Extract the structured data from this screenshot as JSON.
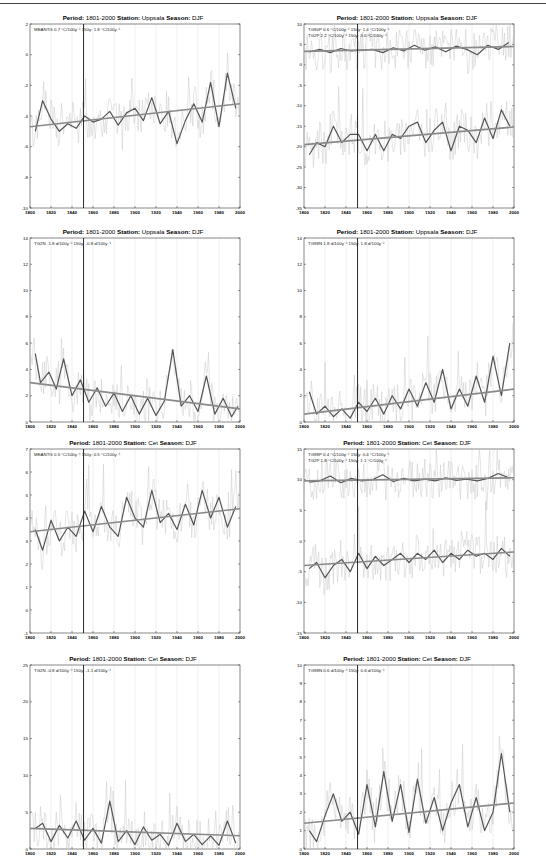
{
  "chart_data": [
    {
      "id": "p1",
      "type": "line",
      "title": {
        "period_label": "Period:",
        "period": "1801-2000",
        "station_label": "Station:",
        "station": "Uppsala",
        "season_label": "Season:",
        "season": "DJF"
      },
      "legend": [
        "MEANTG   0.7 °C/100y⁻¹ 150y: 1.8 °C/100y⁻¹"
      ],
      "xlim": [
        1800,
        2000
      ],
      "ylim": [
        -10,
        2
      ],
      "xticks": [
        "1800",
        "1820",
        "1840",
        "1860",
        "1880",
        "1900",
        "1920",
        "1940",
        "1960",
        "1980",
        "2000"
      ],
      "yticks": [
        "-10",
        "-8",
        "-6",
        "-4",
        "-2",
        "0",
        "2"
      ],
      "vline_year": 1851,
      "series": [
        {
          "name": "MEANTG smoothed",
          "x": [
            1805,
            1812,
            1820,
            1828,
            1836,
            1844,
            1852,
            1860,
            1868,
            1876,
            1884,
            1892,
            1900,
            1908,
            1916,
            1924,
            1932,
            1940,
            1948,
            1956,
            1964,
            1972,
            1980,
            1988,
            1996
          ],
          "values": [
            -5.0,
            -3.0,
            -4.2,
            -5.0,
            -4.5,
            -4.8,
            -4.0,
            -4.4,
            -4.2,
            -3.7,
            -4.6,
            -3.8,
            -3.5,
            -4.3,
            -2.8,
            -4.5,
            -3.7,
            -5.8,
            -4.3,
            -3.2,
            -4.4,
            -1.8,
            -4.7,
            -1.2,
            -3.5
          ]
        },
        {
          "name": "MEANTG trend",
          "x": [
            1800,
            2000
          ],
          "values": [
            -4.7,
            -3.2
          ]
        }
      ]
    },
    {
      "id": "p2",
      "type": "line",
      "title": {
        "period_label": "Period:",
        "period": "1801-2000",
        "station_label": "Station:",
        "station": "Uppsala",
        "season_label": "Season:",
        "season": "DJF"
      },
      "legend": [
        "TG90P   0.6 °C/100y⁻¹ 150y: 1.4 °C/100y⁻¹",
        "TG2P    2.2 °C/100y⁻¹ 150y: 3.0 °C/100y⁻¹"
      ],
      "xlim": [
        1800,
        2000
      ],
      "ylim": [
        -35,
        10
      ],
      "xticks": [
        "1800",
        "1820",
        "1840",
        "1860",
        "1880",
        "1900",
        "1920",
        "1940",
        "1960",
        "1980",
        "2000"
      ],
      "yticks": [
        "-35",
        "-30",
        "-25",
        "-20",
        "-15",
        "-10",
        "-5",
        "0",
        "5",
        "10"
      ],
      "vline_year": 1851,
      "series": [
        {
          "name": "TG90P smoothed",
          "x": [
            1805,
            1815,
            1825,
            1835,
            1845,
            1855,
            1865,
            1875,
            1885,
            1895,
            1905,
            1915,
            1925,
            1935,
            1945,
            1955,
            1965,
            1975,
            1985,
            1995
          ],
          "values": [
            3.2,
            3.8,
            3.0,
            4.0,
            3.4,
            3.6,
            3.8,
            3.0,
            4.2,
            3.4,
            4.8,
            3.6,
            4.4,
            3.2,
            4.6,
            3.8,
            2.5,
            4.8,
            3.8,
            5.5
          ]
        },
        {
          "name": "TG90P trend",
          "x": [
            1800,
            2000
          ],
          "values": [
            3.3,
            4.5
          ]
        },
        {
          "name": "TG2P smoothed",
          "x": [
            1805,
            1812,
            1820,
            1828,
            1836,
            1844,
            1852,
            1860,
            1868,
            1876,
            1884,
            1892,
            1900,
            1908,
            1916,
            1924,
            1932,
            1940,
            1948,
            1956,
            1964,
            1972,
            1980,
            1988,
            1996
          ],
          "values": [
            -22,
            -19,
            -20,
            -15,
            -19,
            -17,
            -17,
            -21,
            -17,
            -21,
            -17,
            -18,
            -15,
            -14,
            -19,
            -16,
            -14,
            -21,
            -15,
            -16,
            -19,
            -13,
            -18,
            -11,
            -15
          ]
        },
        {
          "name": "TG2P trend",
          "x": [
            1800,
            2000
          ],
          "values": [
            -19.5,
            -15.2
          ]
        }
      ]
    },
    {
      "id": "p3",
      "type": "line",
      "title": {
        "period_label": "Period:",
        "period": "1801-2000",
        "station_label": "Station:",
        "station": "Uppsala",
        "season_label": "Season:",
        "season": "DJF"
      },
      "legend": [
        "TG2N   -1.8 d/100y⁻¹ 150y: -0.8 d/100y⁻¹"
      ],
      "xlim": [
        1800,
        2000
      ],
      "ylim": [
        0,
        14
      ],
      "xticks": [
        "1800",
        "1820",
        "1840",
        "1860",
        "1880",
        "1900",
        "1920",
        "1940",
        "1960",
        "1980",
        "2000"
      ],
      "yticks": [
        "0",
        "2",
        "4",
        "6",
        "8",
        "10",
        "12",
        "14"
      ],
      "vline_year": 1851,
      "series": [
        {
          "name": "TG2N smoothed",
          "x": [
            1805,
            1810,
            1818,
            1825,
            1832,
            1840,
            1848,
            1856,
            1864,
            1872,
            1880,
            1888,
            1896,
            1904,
            1912,
            1920,
            1928,
            1936,
            1944,
            1952,
            1960,
            1968,
            1976,
            1984,
            1992,
            1998
          ],
          "values": [
            5.2,
            3.0,
            3.8,
            2.5,
            4.8,
            2.0,
            3.2,
            1.5,
            2.6,
            1.2,
            2.2,
            0.8,
            2.0,
            0.6,
            1.8,
            0.5,
            1.6,
            5.5,
            1.2,
            2.0,
            0.8,
            3.5,
            0.6,
            1.8,
            0.4,
            1.2
          ]
        },
        {
          "name": "TG2N trend",
          "x": [
            1800,
            2000
          ],
          "values": [
            3.0,
            1.0
          ]
        }
      ]
    },
    {
      "id": "p4",
      "type": "line",
      "title": {
        "period_label": "Period:",
        "period": "1801-2000",
        "station_label": "Station:",
        "station": "Uppsala",
        "season_label": "Season:",
        "season": "DJF"
      },
      "legend": [
        "TG98N   1.8 d/100y⁻¹ 150y: 1.8 d/100y⁻¹"
      ],
      "xlim": [
        1800,
        2000
      ],
      "ylim": [
        0,
        14
      ],
      "xticks": [
        "1800",
        "1820",
        "1840",
        "1860",
        "1880",
        "1900",
        "1920",
        "1940",
        "1960",
        "1980",
        "2000"
      ],
      "yticks": [
        "0",
        "2",
        "4",
        "6",
        "8",
        "10",
        "12",
        "14"
      ],
      "vline_year": 1851,
      "series": [
        {
          "name": "TG98N smoothed",
          "x": [
            1805,
            1812,
            1820,
            1828,
            1836,
            1844,
            1852,
            1860,
            1868,
            1876,
            1884,
            1892,
            1900,
            1908,
            1916,
            1924,
            1932,
            1940,
            1948,
            1956,
            1964,
            1972,
            1980,
            1988,
            1996
          ],
          "values": [
            2.3,
            0.6,
            1.2,
            0.4,
            1.0,
            0.3,
            1.5,
            0.8,
            1.8,
            0.6,
            2.0,
            1.0,
            2.5,
            1.2,
            3.0,
            1.5,
            4.0,
            1.0,
            2.5,
            1.2,
            3.5,
            1.5,
            5.0,
            2.0,
            6.0
          ]
        },
        {
          "name": "TG98N trend",
          "x": [
            1800,
            2000
          ],
          "values": [
            0.6,
            2.5
          ]
        }
      ]
    },
    {
      "id": "p5",
      "type": "line",
      "title": {
        "period_label": "Period:",
        "period": "1801-2000",
        "station_label": "Station:",
        "station": "Cet",
        "season_label": "Season:",
        "season": "DJF"
      },
      "legend": [
        "MEANTG   0.5 °C/100y⁻¹ 150y: 0.5 °C/100y⁻¹"
      ],
      "xlim": [
        1800,
        2000
      ],
      "ylim": [
        -1,
        7
      ],
      "xticks": [
        "1800",
        "1820",
        "1840",
        "1860",
        "1880",
        "1900",
        "1920",
        "1940",
        "1960",
        "1980",
        "2000"
      ],
      "yticks": [
        "-1",
        "0",
        "1",
        "2",
        "3",
        "4",
        "5",
        "6",
        "7"
      ],
      "vline_year": 1851,
      "series": [
        {
          "name": "MEANTG smoothed",
          "x": [
            1805,
            1812,
            1820,
            1828,
            1836,
            1844,
            1852,
            1860,
            1868,
            1876,
            1884,
            1892,
            1900,
            1908,
            1916,
            1924,
            1932,
            1940,
            1948,
            1956,
            1964,
            1972,
            1980,
            1988,
            1996
          ],
          "values": [
            3.5,
            2.6,
            3.9,
            3.0,
            3.6,
            3.2,
            4.3,
            3.4,
            4.5,
            3.6,
            3.2,
            4.9,
            4.0,
            3.6,
            5.2,
            3.8,
            4.2,
            3.5,
            4.6,
            3.7,
            5.2,
            4.0,
            4.9,
            3.6,
            4.5
          ]
        },
        {
          "name": "MEANTG trend",
          "x": [
            1800,
            2000
          ],
          "values": [
            3.4,
            4.4
          ]
        }
      ]
    },
    {
      "id": "p6",
      "type": "line",
      "title": {
        "period_label": "Period:",
        "period": "1801-2000",
        "station_label": "Station:",
        "station": "Cet",
        "season_label": "Season:",
        "season": "DJF"
      },
      "legend": [
        "TG98P   0.4 °C/100y⁻¹ 150y: 0.4 °C/100y⁻¹",
        "TG2P    1.8 °C/100y⁻¹ 150y: 1.1 °C/100y⁻¹"
      ],
      "xlim": [
        1800,
        2000
      ],
      "ylim": [
        -15,
        15
      ],
      "xticks": [
        "1800",
        "1820",
        "1840",
        "1860",
        "1880",
        "1900",
        "1920",
        "1940",
        "1960",
        "1980",
        "2000"
      ],
      "yticks": [
        "-15",
        "-10",
        "-5",
        "0",
        "5",
        "10",
        "15"
      ],
      "vline_year": 1851,
      "series": [
        {
          "name": "TG98P smoothed",
          "x": [
            1805,
            1815,
            1825,
            1835,
            1845,
            1855,
            1865,
            1875,
            1885,
            1895,
            1905,
            1915,
            1925,
            1935,
            1945,
            1955,
            1965,
            1975,
            1985,
            1995
          ],
          "values": [
            9.6,
            9.8,
            10.6,
            9.5,
            10.2,
            9.8,
            10.0,
            10.8,
            9.7,
            10.2,
            9.8,
            10.1,
            9.8,
            10.3,
            9.9,
            10.1,
            9.8,
            10.2,
            11.0,
            10.3
          ]
        },
        {
          "name": "TG98P trend",
          "x": [
            1800,
            2000
          ],
          "values": [
            9.8,
            10.3
          ]
        },
        {
          "name": "TG2P smoothed",
          "x": [
            1805,
            1812,
            1820,
            1828,
            1836,
            1844,
            1852,
            1860,
            1868,
            1876,
            1884,
            1892,
            1900,
            1908,
            1916,
            1924,
            1932,
            1940,
            1948,
            1956,
            1964,
            1972,
            1980,
            1988,
            1996
          ],
          "values": [
            -4.5,
            -3.5,
            -6.0,
            -4.0,
            -3.0,
            -5.0,
            -2.0,
            -4.5,
            -2.5,
            -4.0,
            -3.0,
            -2.0,
            -3.5,
            -2.0,
            -3.0,
            -1.5,
            -3.5,
            -2.0,
            -3.0,
            -1.5,
            -2.5,
            -2.0,
            -3.0,
            -1.2,
            -2.5
          ]
        },
        {
          "name": "TG2P trend",
          "x": [
            1800,
            2000
          ],
          "values": [
            -4.0,
            -1.8
          ]
        }
      ]
    },
    {
      "id": "p7",
      "type": "line",
      "title": {
        "period_label": "Period:",
        "period": "1801-2000",
        "station_label": "Station:",
        "station": "Cet",
        "season_label": "Season:",
        "season": "DJF"
      },
      "legend": [
        "TG2N   -0.8 d/100y⁻¹ 150y: -1.1 d/100y⁻¹"
      ],
      "xlim": [
        1800,
        2000
      ],
      "ylim": [
        0,
        25
      ],
      "xticks": [
        "1800",
        "1820",
        "1840",
        "1860",
        "1880",
        "1900",
        "1920",
        "1940",
        "1960",
        "1980",
        "2000"
      ],
      "yticks": [
        "0",
        "5",
        "10",
        "15",
        "20",
        "25"
      ],
      "vline_year": 1851,
      "series": [
        {
          "name": "TG2N smoothed",
          "x": [
            1805,
            1812,
            1820,
            1828,
            1836,
            1844,
            1852,
            1860,
            1868,
            1876,
            1884,
            1892,
            1900,
            1908,
            1916,
            1924,
            1932,
            1940,
            1948,
            1956,
            1964,
            1972,
            1980,
            1988,
            1996
          ],
          "values": [
            2.8,
            3.5,
            1.0,
            3.2,
            1.5,
            3.8,
            1.2,
            2.8,
            0.8,
            6.5,
            1.0,
            2.5,
            0.6,
            3.0,
            1.2,
            2.0,
            0.5,
            3.5,
            1.0,
            2.0,
            0.6,
            1.8,
            0.5,
            3.8,
            0.8
          ]
        },
        {
          "name": "TG2N trend",
          "x": [
            1800,
            2000
          ],
          "values": [
            2.8,
            1.8
          ]
        }
      ]
    },
    {
      "id": "p8",
      "type": "line",
      "title": {
        "period_label": "Period:",
        "period": "1801-2000",
        "station_label": "Station:",
        "station": "Cet",
        "season_label": "Season:",
        "season": "DJF"
      },
      "legend": [
        "TG98N   0.6 d/100y⁻¹ 150y: 0.6 d/100y⁻¹"
      ],
      "xlim": [
        1800,
        2000
      ],
      "ylim": [
        0,
        10
      ],
      "xticks": [
        "1800",
        "1820",
        "1840",
        "1860",
        "1880",
        "1900",
        "1920",
        "1940",
        "1960",
        "1980",
        "2000"
      ],
      "yticks": [
        "0",
        "1",
        "2",
        "3",
        "4",
        "5",
        "6",
        "7",
        "8",
        "9",
        "10"
      ],
      "vline_year": 1851,
      "series": [
        {
          "name": "TG98N smoothed",
          "x": [
            1805,
            1812,
            1820,
            1828,
            1836,
            1844,
            1852,
            1860,
            1868,
            1876,
            1884,
            1892,
            1900,
            1908,
            1916,
            1924,
            1932,
            1940,
            1948,
            1956,
            1964,
            1972,
            1980,
            1988,
            1996
          ],
          "values": [
            1.0,
            0.4,
            1.8,
            3.0,
            1.5,
            2.0,
            0.8,
            3.5,
            1.2,
            4.2,
            1.5,
            3.5,
            0.9,
            3.8,
            1.4,
            2.8,
            1.0,
            2.5,
            3.5,
            1.2,
            2.8,
            1.0,
            2.0,
            5.2,
            2.0
          ]
        },
        {
          "name": "TG98N trend",
          "x": [
            1800,
            2000
          ],
          "values": [
            1.4,
            2.5
          ]
        }
      ]
    }
  ]
}
